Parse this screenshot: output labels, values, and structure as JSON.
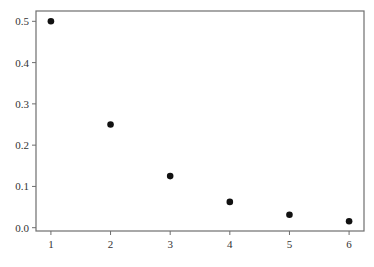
{
  "chart_data": {
    "type": "scatter",
    "title": "",
    "xlabel": "",
    "ylabel": "",
    "x": [
      1,
      2,
      3,
      4,
      5,
      6
    ],
    "series": [
      {
        "name": "",
        "values": [
          0.5,
          0.25,
          0.125,
          0.0625,
          0.03125,
          0.015625
        ]
      }
    ],
    "x_ticks": [
      "1",
      "2",
      "3",
      "4",
      "5",
      "6"
    ],
    "y_ticks": [
      "0.0",
      "0.1",
      "0.2",
      "0.3",
      "0.4",
      "0.5"
    ],
    "xlim": [
      0.75,
      6.25
    ],
    "ylim": [
      -0.008,
      0.525
    ],
    "grid": false,
    "legend": null,
    "marker_color": "#111111",
    "frame_color": "#6e6e6e"
  }
}
